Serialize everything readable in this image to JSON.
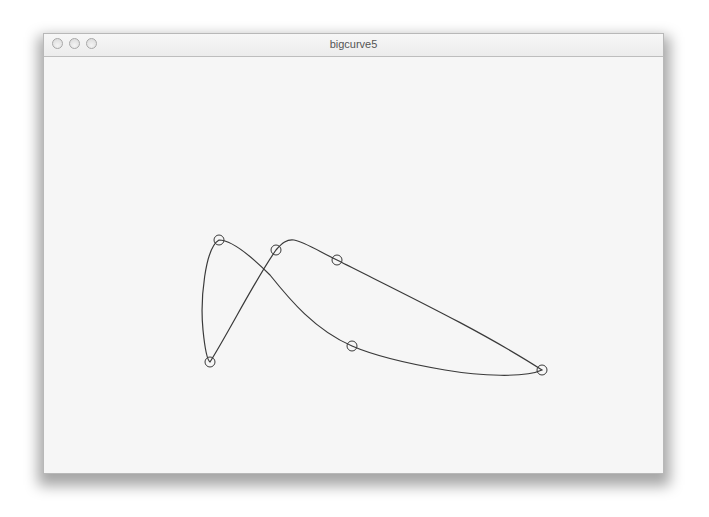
{
  "window": {
    "title": "bigcurve5",
    "controls": [
      {
        "name": "close-button"
      },
      {
        "name": "minimize-button"
      },
      {
        "name": "zoom-button"
      }
    ]
  },
  "canvas": {
    "stroke_color": "#3a3a3a",
    "background": "#f6f6f6",
    "control_points": [
      {
        "x": 219,
        "y": 240
      },
      {
        "x": 210,
        "y": 362
      },
      {
        "x": 276,
        "y": 250
      },
      {
        "x": 337,
        "y": 260
      },
      {
        "x": 542,
        "y": 370
      },
      {
        "x": 352,
        "y": 346
      }
    ],
    "control_point_radius": 5
  }
}
